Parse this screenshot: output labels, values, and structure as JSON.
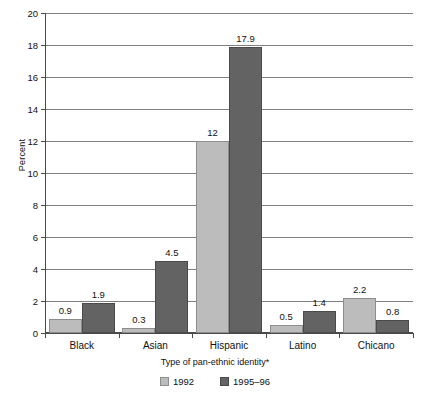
{
  "chart_data": {
    "type": "bar",
    "title": "",
    "xlabel": "Type of pan-ethnic identity*",
    "ylabel": "Percent",
    "ylim": [
      0,
      20
    ],
    "ytick_step": 2,
    "yticks": [
      0,
      2,
      4,
      6,
      8,
      10,
      12,
      14,
      16,
      18,
      20
    ],
    "ytick_labels": [
      "0",
      "2",
      "4",
      "6",
      "8",
      "10",
      "12",
      "14",
      "16",
      "18",
      "20"
    ],
    "categories": [
      "Black",
      "Asian",
      "Hispanic",
      "Latino",
      "Chicano"
    ],
    "series": [
      {
        "name": "1992",
        "color": "#bcbcbc",
        "values": [
          0.9,
          0.3,
          12,
          0.5,
          2.2
        ],
        "labels": [
          "0.9",
          "0.3",
          "12",
          "0.5",
          "2.2"
        ]
      },
      {
        "name": "1995–96",
        "color": "#636363",
        "values": [
          1.9,
          4.5,
          17.9,
          1.4,
          0.8
        ],
        "labels": [
          "1.9",
          "4.5",
          "17.9",
          "1.4",
          "0.8"
        ]
      }
    ],
    "grid": true,
    "grid_axis": "y",
    "legend_position": "bottom",
    "bar_mode": "grouped",
    "background": "#ffffff"
  }
}
